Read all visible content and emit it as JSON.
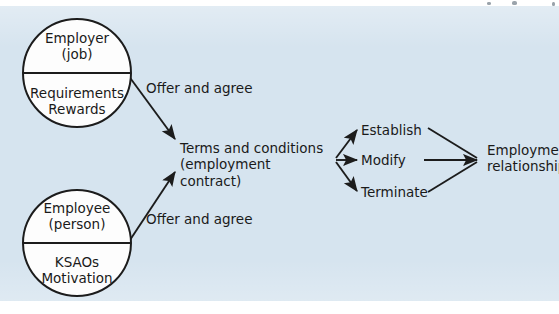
{
  "diagram": {
    "background_color": "#d6e4ef",
    "ink_color": "#1a1a1a",
    "node_fill": "#fdfdfd",
    "nodes": {
      "employer": {
        "top_line_1": "Employer",
        "top_line_2": "(job)",
        "bottom_line_1": "Requirements",
        "bottom_line_2": "Rewards"
      },
      "employee": {
        "top_line_1": "Employee",
        "top_line_2": "(person)",
        "bottom_line_1": "KSAOs",
        "bottom_line_2": "Motivation"
      },
      "contract": {
        "line_1": "Terms and conditions",
        "line_2": "(employment contract)"
      },
      "outcome": {
        "line_1": "Employment",
        "line_2": "relationship"
      }
    },
    "edge_labels": {
      "employer_offer": "Offer and agree",
      "employee_offer": "Offer and agree"
    },
    "actions": [
      {
        "label": "Establish"
      },
      {
        "label": "Modify"
      },
      {
        "label": "Terminate"
      }
    ]
  }
}
